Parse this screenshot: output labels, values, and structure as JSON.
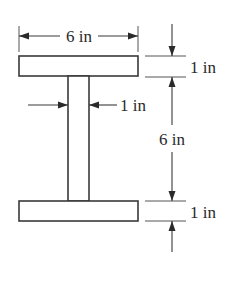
{
  "diagram": {
    "type": "I-beam cross-section",
    "colors": {
      "stroke": "#3a3a3a",
      "text": "#2a2a2a",
      "background": "#ffffff"
    },
    "labels": {
      "flange_width": "6 in",
      "top_flange_thickness": "1 in",
      "web_thickness": "1 in",
      "web_height": "6 in",
      "bottom_flange_thickness": "1 in"
    },
    "dimensions_in": {
      "flange_width": 6,
      "top_flange_thickness": 1,
      "web_thickness": 1,
      "web_height": 6,
      "bottom_flange_thickness": 1
    }
  }
}
